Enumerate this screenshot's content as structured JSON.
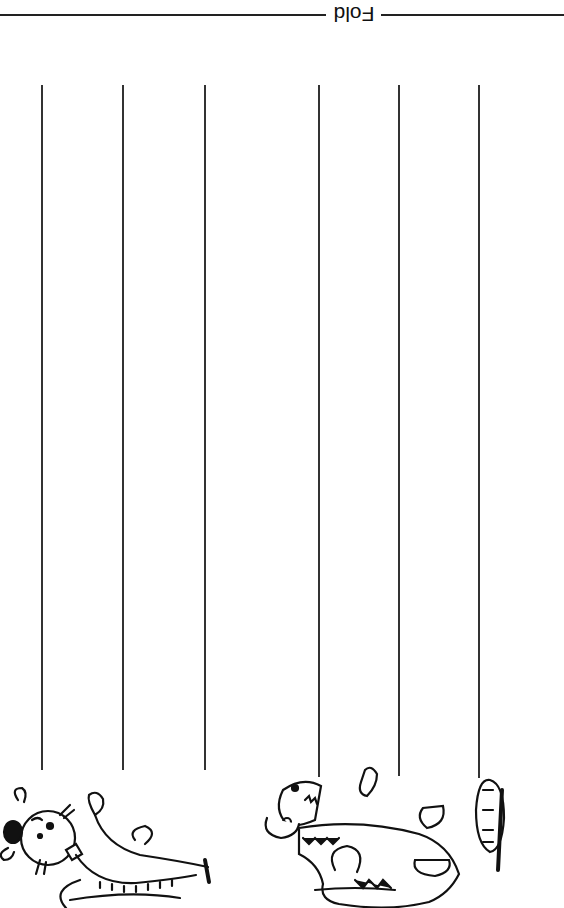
{
  "fold": {
    "label": "Fold"
  },
  "writing_lines": [
    {
      "x": 41,
      "top": 85,
      "bottom": 770
    },
    {
      "x": 122,
      "top": 85,
      "bottom": 770
    },
    {
      "x": 204,
      "top": 85,
      "bottom": 770
    },
    {
      "x": 318,
      "top": 85,
      "bottom": 777
    },
    {
      "x": 398,
      "top": 85,
      "bottom": 776
    },
    {
      "x": 478,
      "top": 85,
      "bottom": 778
    }
  ],
  "illustrations": [
    {
      "name": "tiger-cat-cartoon",
      "orientation": "upside-down"
    },
    {
      "name": "dinosaur-skateboard-cartoon",
      "orientation": "upside-down"
    }
  ],
  "colors": {
    "ink": "#111111",
    "paper": "#ffffff"
  }
}
